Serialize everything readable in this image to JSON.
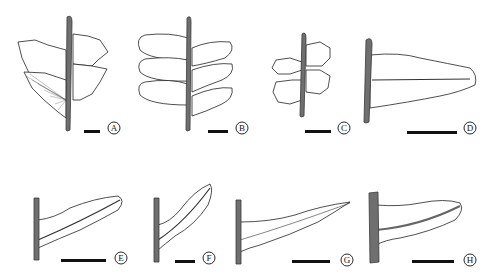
{
  "figure": {
    "panels": [
      {
        "label": "A"
      },
      {
        "label": "B"
      },
      {
        "label": "C"
      },
      {
        "label": "D"
      },
      {
        "label": "E"
      },
      {
        "label": "F"
      },
      {
        "label": "G"
      },
      {
        "label": "H"
      }
    ]
  }
}
